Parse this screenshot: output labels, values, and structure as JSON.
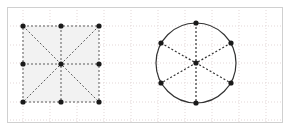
{
  "canvas": {
    "width": 289,
    "height": 129,
    "background": "#ffffff",
    "frame": {
      "x": 7,
      "y": 7,
      "width": 275,
      "height": 115,
      "stroke": "#d0d0d0",
      "stroke_width": 1
    }
  },
  "grid": {
    "style": "dotted",
    "color": "#e3d7d7",
    "stroke_width": 1,
    "dash": "1,2",
    "spacing": 27,
    "x_lines": [
      23,
      50,
      77,
      104,
      131,
      158,
      185,
      212,
      239,
      266
    ],
    "y_lines": [
      26,
      45,
      63,
      83,
      102,
      120
    ]
  },
  "figures": [
    {
      "name": "square-figure",
      "type": "square",
      "fill": "#f2f2f2",
      "stroke": "#5a5a5a",
      "stroke_width": 1,
      "dash": "2,2",
      "x": 23,
      "y": 26,
      "width": 76,
      "height": 76,
      "center": [
        61,
        64
      ],
      "spokes": 8,
      "point_color": "#1a1a1a",
      "point_radius": 2.6,
      "points": [
        {
          "label": "top-left-corner",
          "x": 23,
          "y": 26
        },
        {
          "label": "top-midpoint",
          "x": 61,
          "y": 26
        },
        {
          "label": "top-right-corner",
          "x": 99,
          "y": 26
        },
        {
          "label": "left-midpoint",
          "x": 23,
          "y": 64
        },
        {
          "label": "center",
          "x": 61,
          "y": 64
        },
        {
          "label": "right-midpoint",
          "x": 99,
          "y": 64
        },
        {
          "label": "bottom-left-corner",
          "x": 23,
          "y": 102
        },
        {
          "label": "bottom-midpoint",
          "x": 61,
          "y": 102
        },
        {
          "label": "bottom-right-corner",
          "x": 99,
          "y": 102
        }
      ],
      "spoke_lines": [
        {
          "label": "diagonal-tl-br",
          "x1": 23,
          "y1": 26,
          "x2": 99,
          "y2": 102
        },
        {
          "label": "diagonal-tr-bl",
          "x1": 99,
          "y1": 26,
          "x2": 23,
          "y2": 102
        },
        {
          "label": "median-vertical",
          "x1": 61,
          "y1": 26,
          "x2": 61,
          "y2": 102
        },
        {
          "label": "median-horizontal",
          "x1": 23,
          "y1": 64,
          "x2": 99,
          "y2": 64
        }
      ]
    },
    {
      "name": "circle-figure",
      "type": "circle",
      "fill": "none",
      "stroke": "#333333",
      "stroke_width": 1.2,
      "dash": "2,2",
      "cx": 196,
      "cy": 63,
      "r": 40,
      "spokes": 6,
      "point_color": "#1a1a1a",
      "point_radius": 2.6,
      "points": [
        {
          "label": "vertex-90",
          "x": 196,
          "y": 23
        },
        {
          "label": "vertex-30",
          "x": 231,
          "y": 43
        },
        {
          "label": "vertex-330",
          "x": 231,
          "y": 83
        },
        {
          "label": "vertex-270",
          "x": 196,
          "y": 103
        },
        {
          "label": "vertex-210",
          "x": 161,
          "y": 83
        },
        {
          "label": "vertex-150",
          "x": 161,
          "y": 43
        },
        {
          "label": "center",
          "x": 196,
          "y": 63
        }
      ],
      "spoke_lines": [
        {
          "label": "diameter-vertical",
          "x1": 196,
          "y1": 23,
          "x2": 196,
          "y2": 103
        },
        {
          "label": "diameter-ne-sw",
          "x1": 231,
          "y1": 43,
          "x2": 161,
          "y2": 83
        },
        {
          "label": "diameter-nw-se",
          "x1": 161,
          "y1": 43,
          "x2": 231,
          "y2": 83
        }
      ]
    }
  ]
}
